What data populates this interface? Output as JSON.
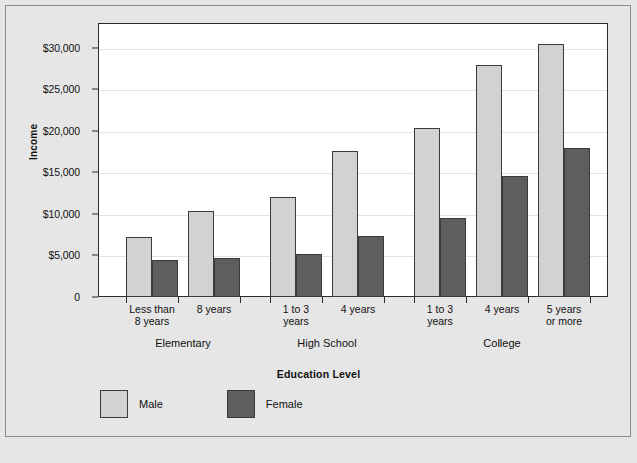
{
  "chart_data": {
    "type": "bar",
    "title": "",
    "xlabel": "Education Level",
    "ylabel": "Income",
    "categories": [
      "Less than\n8 years",
      "8 years",
      "1 to 3\nyears",
      "4 years",
      "1 to 3\nyears",
      "4 years",
      "5 years\nor more"
    ],
    "groups": [
      {
        "label": "Elementary",
        "categories": [
          "Less than\n8 years",
          "8 years"
        ]
      },
      {
        "label": "High School",
        "categories": [
          "1 to 3\nyears",
          "4 years"
        ]
      },
      {
        "label": "College",
        "categories": [
          "1 to 3\nyears",
          "4 years",
          "5 years\nor more"
        ]
      }
    ],
    "series": [
      {
        "name": "Male",
        "color": "#d2d2d2",
        "values": [
          7200,
          10400,
          12100,
          17600,
          20300,
          28000,
          30500
        ]
      },
      {
        "name": "Female",
        "color": "#5e5e5e",
        "values": [
          4400,
          4700,
          5200,
          7400,
          9500,
          14600,
          18000
        ]
      }
    ],
    "ylim": [
      0,
      33000
    ],
    "yticks": [
      0,
      5000,
      10000,
      15000,
      20000,
      25000,
      30000
    ],
    "ytick_labels": [
      "0",
      "$5,000",
      "$10,000",
      "$15,000",
      "$20,000",
      "$25,000",
      "$30,000"
    ],
    "grid": true,
    "legend_position": "bottom-left"
  },
  "legend": {
    "items": [
      {
        "label": "Male",
        "color": "#d2d2d2"
      },
      {
        "label": "Female",
        "color": "#5e5e5e"
      }
    ]
  },
  "axis_titles": {
    "x": "Education Level",
    "y": "Income"
  }
}
